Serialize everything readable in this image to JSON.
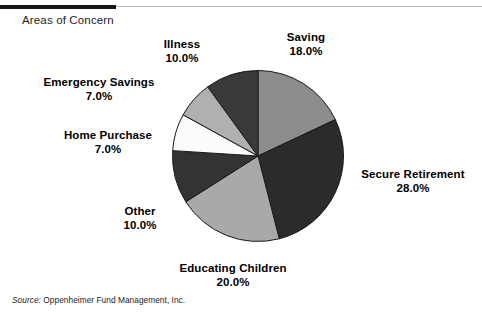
{
  "header": {
    "caption": "Areas of Concern",
    "rule_thick_color": "#151515",
    "rule_thin_color": "#b9b9b9"
  },
  "source": {
    "prefix": "Source:",
    "text": "Oppenheimer Fund Management, Inc."
  },
  "labels": {
    "saving": {
      "name": "Saving",
      "value": "18.0%"
    },
    "illness": {
      "name": "Illness",
      "value": "10.0%"
    },
    "emergency_savings": {
      "name": "Emergency Savings",
      "value": "7.0%"
    },
    "home_purchase": {
      "name": "Home Purchase",
      "value": "7.0%"
    },
    "other": {
      "name": "Other",
      "value": "10.0%"
    },
    "educating_children": {
      "name": "Educating Children",
      "value": "20.0%"
    },
    "secure_retirement": {
      "name": "Secure Retirement",
      "value": "28.0%"
    }
  },
  "chart_data": {
    "type": "pie",
    "title": "Areas of Concern",
    "xlabel": "",
    "ylabel": "",
    "units": "percent",
    "total": 100.0,
    "start_angle_deg": 0,
    "direction": "clockwise",
    "legend": "none-labels-outside",
    "grid": false,
    "categories": [
      "Saving",
      "Secure Retirement",
      "Educating Children",
      "Other",
      "Home Purchase",
      "Emergency Savings",
      "Illness"
    ],
    "values": [
      18.0,
      28.0,
      20.0,
      10.0,
      7.0,
      7.0,
      10.0
    ],
    "value_labels": [
      "18.0%",
      "28.0%",
      "20.0%",
      "10.0%",
      "7.0%",
      "7.0%",
      "10.0%"
    ],
    "slice_colors": [
      "#8c8c8c",
      "#2b2b2b",
      "#a9a9a9",
      "#333333",
      "#fbfbfb",
      "#b0b0b0",
      "#3a3a3a"
    ],
    "slice_outline_color": "#1a1a1a",
    "slices": [
      {
        "label": "Saving",
        "value": 18.0,
        "display": "18.0%",
        "color": "#8c8c8c",
        "start_deg": 0.0,
        "end_deg": 64.8
      },
      {
        "label": "Secure Retirement",
        "value": 28.0,
        "display": "28.0%",
        "color": "#2b2b2b",
        "start_deg": 64.8,
        "end_deg": 165.6
      },
      {
        "label": "Educating Children",
        "value": 20.0,
        "display": "20.0%",
        "color": "#a9a9a9",
        "start_deg": 165.6,
        "end_deg": 237.6
      },
      {
        "label": "Other",
        "value": 10.0,
        "display": "10.0%",
        "color": "#333333",
        "start_deg": 237.6,
        "end_deg": 273.6
      },
      {
        "label": "Home Purchase",
        "value": 7.0,
        "display": "7.0%",
        "color": "#fbfbfb",
        "start_deg": 273.6,
        "end_deg": 298.8
      },
      {
        "label": "Emergency Savings",
        "value": 7.0,
        "display": "7.0%",
        "color": "#b0b0b0",
        "start_deg": 298.8,
        "end_deg": 324.0
      },
      {
        "label": "Illness",
        "value": 10.0,
        "display": "10.0%",
        "color": "#3a3a3a",
        "start_deg": 324.0,
        "end_deg": 360.0
      }
    ]
  }
}
